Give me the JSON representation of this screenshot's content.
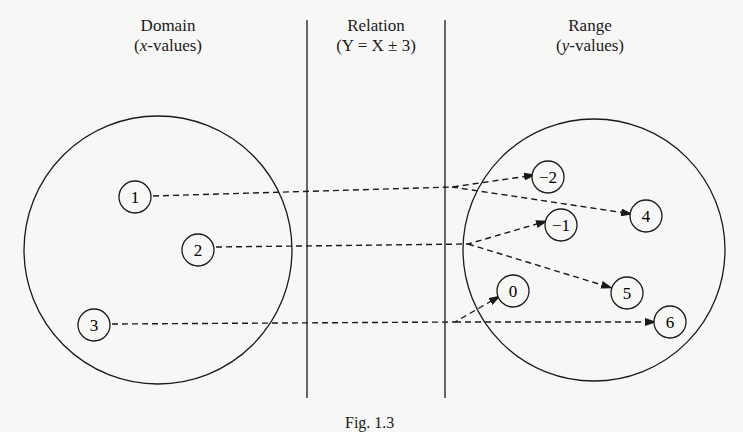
{
  "headers": {
    "domain": {
      "title": "Domain",
      "subtitle_var": "x",
      "subtitle_rest": "-values)"
    },
    "relation": {
      "title": "Relation",
      "subtitle": "(Y = X ± 3)"
    },
    "range": {
      "title": "Range",
      "subtitle_var": "y",
      "subtitle_rest": "-values)"
    }
  },
  "domain_values": [
    {
      "label": "1",
      "cx": 135,
      "cy": 197
    },
    {
      "label": "2",
      "cx": 198,
      "cy": 250
    },
    {
      "label": "3",
      "cx": 94,
      "cy": 325
    }
  ],
  "range_values": [
    {
      "label": "−2",
      "cx": 548,
      "cy": 177
    },
    {
      "label": "4",
      "cx": 646,
      "cy": 216
    },
    {
      "label": "−1",
      "cx": 561,
      "cy": 225
    },
    {
      "label": "5",
      "cx": 627,
      "cy": 293
    },
    {
      "label": "0",
      "cx": 513,
      "cy": 291
    },
    {
      "label": "6",
      "cx": 670,
      "cy": 322
    }
  ],
  "mappings": [
    {
      "from": "1",
      "to": "−2"
    },
    {
      "from": "1",
      "to": "4"
    },
    {
      "from": "2",
      "to": "−1"
    },
    {
      "from": "2",
      "to": "5"
    },
    {
      "from": "3",
      "to": "0"
    },
    {
      "from": "3",
      "to": "6"
    }
  ],
  "caption": "Fig. 1.3"
}
